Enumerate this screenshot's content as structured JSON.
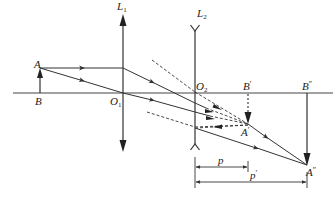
{
  "diagram": {
    "type": "optics-ray-diagram",
    "colors": {
      "line": "#333333",
      "background": "#ffffff"
    },
    "labels": {
      "A": "A",
      "B": "B",
      "L1": "L",
      "L1_sub": "1",
      "L2": "L",
      "L2_sub": "2",
      "O1": "O",
      "O1_sub": "1",
      "O2": "O",
      "O2_sub": "2",
      "B_prime": "B",
      "B_prime_mark": "′",
      "A_prime": "A",
      "A_prime_mark": "′",
      "B_double": "B",
      "B_double_mark": "″",
      "A_double": "A",
      "A_double_mark": "″",
      "p": "p",
      "p_prime": "p",
      "p_prime_mark": "′"
    },
    "elements": {
      "optical_axis": "principal optical axis",
      "lens_1": "converging lens L1",
      "lens_2": "diverging lens L2",
      "object": "object AB",
      "intermediate_image": "virtual image A'B'",
      "final_image": "final image A''B''",
      "distance_p": "p",
      "distance_p_prime": "p'"
    }
  }
}
